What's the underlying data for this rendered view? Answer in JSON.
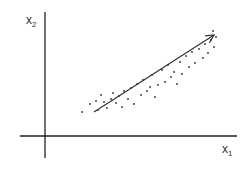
{
  "diagram": {
    "x_axis_label": "x",
    "x_axis_subscript": "1",
    "y_axis_label": "x",
    "y_axis_subscript": "2",
    "arrow": {
      "from": [
        94,
        112
      ],
      "to": [
        214,
        35
      ]
    },
    "colors": {
      "axis": "#222222",
      "points": "#333333",
      "arrow": "#333333"
    }
  },
  "chart_data": {
    "type": "scatter",
    "title": "",
    "xlabel": "x1",
    "ylabel": "x2",
    "grid": false,
    "annotations": [
      "arrow along principal direction of the point cloud"
    ],
    "points_px": [
      [
        82,
        112
      ],
      [
        90,
        104
      ],
      [
        96,
        101
      ],
      [
        98,
        110
      ],
      [
        101,
        95
      ],
      [
        104,
        102
      ],
      [
        107,
        108
      ],
      [
        111,
        99
      ],
      [
        113,
        93
      ],
      [
        116,
        103
      ],
      [
        119,
        96
      ],
      [
        122,
        107
      ],
      [
        124,
        91
      ],
      [
        128,
        99
      ],
      [
        131,
        88
      ],
      [
        134,
        104
      ],
      [
        137,
        84
      ],
      [
        141,
        95
      ],
      [
        143,
        80
      ],
      [
        147,
        91
      ],
      [
        150,
        87
      ],
      [
        152,
        75
      ],
      [
        155,
        97
      ],
      [
        158,
        85
      ],
      [
        162,
        70
      ],
      [
        165,
        82
      ],
      [
        168,
        65
      ],
      [
        171,
        77
      ],
      [
        174,
        72
      ],
      [
        177,
        84
      ],
      [
        180,
        62
      ],
      [
        182,
        74
      ],
      [
        186,
        56
      ],
      [
        189,
        67
      ],
      [
        192,
        52
      ],
      [
        195,
        63
      ],
      [
        199,
        49
      ],
      [
        203,
        58
      ],
      [
        205,
        44
      ],
      [
        208,
        53
      ],
      [
        211,
        40
      ],
      [
        213,
        31
      ],
      [
        214,
        47
      ],
      [
        216,
        37
      ]
    ]
  }
}
